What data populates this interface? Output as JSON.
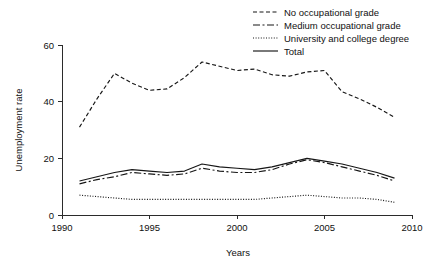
{
  "chart_data": {
    "type": "line",
    "title": "",
    "xlabel": "Years",
    "ylabel": "Unemployment rate",
    "xlim": [
      1990,
      2010
    ],
    "ylim": [
      0,
      60
    ],
    "xticks": [
      1990,
      1995,
      2000,
      2005,
      2010
    ],
    "xtick_labels": [
      "1990",
      "1995",
      "2000",
      "2005",
      "2010"
    ],
    "yticks": [
      0,
      20,
      40,
      60
    ],
    "ytick_labels": [
      "0",
      "20",
      "40",
      "60"
    ],
    "grid": false,
    "legend_position": "top-right",
    "x": [
      1991,
      1992,
      1993,
      1994,
      1995,
      1996,
      1997,
      1998,
      1999,
      2000,
      2001,
      2002,
      2003,
      2004,
      2005,
      2006,
      2007,
      2008,
      2009
    ],
    "series": [
      {
        "name": "No occupational grade",
        "linestyle": "dashed",
        "dasharray": "4,2.5",
        "values": [
          31.0,
          41.0,
          50.0,
          46.5,
          44.0,
          44.5,
          48.5,
          54.0,
          52.5,
          51.0,
          51.5,
          49.5,
          49.0,
          50.5,
          51.0,
          43.5,
          41.0,
          38.0,
          34.5
        ]
      },
      {
        "name": "Medium occupational grade",
        "linestyle": "dash-dot",
        "dasharray": "7,2.5,2,2.5",
        "values": [
          11.0,
          12.5,
          13.5,
          15.0,
          14.5,
          14.0,
          14.5,
          16.5,
          15.5,
          15.0,
          15.0,
          16.0,
          18.0,
          19.5,
          18.5,
          17.0,
          15.5,
          14.0,
          12.0
        ]
      },
      {
        "name": "University and college degree",
        "linestyle": "dotted",
        "dasharray": "1,1.6",
        "values": [
          7.0,
          6.5,
          6.0,
          5.5,
          5.5,
          5.5,
          5.5,
          5.5,
          5.5,
          5.5,
          5.5,
          6.0,
          6.5,
          7.0,
          6.5,
          6.0,
          6.0,
          5.5,
          4.5
        ]
      },
      {
        "name": "Total",
        "linestyle": "solid",
        "dasharray": "",
        "values": [
          12.0,
          13.5,
          15.0,
          16.0,
          15.5,
          15.0,
          15.5,
          18.0,
          17.0,
          16.5,
          16.0,
          17.0,
          18.5,
          20.0,
          19.0,
          18.0,
          16.5,
          15.0,
          13.0
        ]
      }
    ]
  },
  "legend": {
    "items": [
      {
        "label": "No occupational grade"
      },
      {
        "label": "Medium occupational grade"
      },
      {
        "label": "University and college degree"
      },
      {
        "label": "Total"
      }
    ]
  },
  "colors": {
    "line": "#161616",
    "axis": "#2b2b2b",
    "text": "#111111",
    "background": "#ffffff"
  }
}
